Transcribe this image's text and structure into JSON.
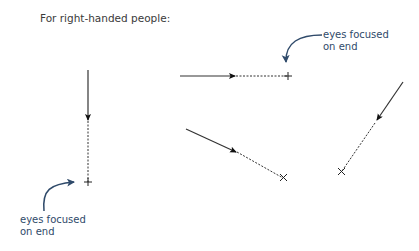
{
  "title": "For right-handed people:",
  "annotations": [
    {
      "line1": "eyes focused",
      "line2": "on end",
      "position": "top-right"
    },
    {
      "line1": "eyes focused",
      "line2": "on end",
      "position": "bottom-left"
    }
  ],
  "colors": {
    "stroke": "#222222",
    "annotation": "#2f4a6a"
  },
  "strokes": [
    {
      "name": "vertical-down",
      "solid": [
        [
          88,
          70
        ],
        [
          88,
          118
        ]
      ],
      "dashed": [
        [
          88,
          118
        ],
        [
          88,
          182
        ]
      ],
      "end": [
        88,
        182
      ]
    },
    {
      "name": "horizontal-right",
      "solid": [
        [
          180,
          76
        ],
        [
          235,
          76
        ]
      ],
      "dashed": [
        [
          235,
          76
        ],
        [
          288,
          76
        ]
      ],
      "end": [
        288,
        76
      ]
    },
    {
      "name": "diagonal-down-right",
      "solid": [
        [
          186,
          129
        ],
        [
          238,
          152
        ]
      ],
      "dashed": [
        [
          238,
          152
        ],
        [
          284,
          178
        ]
      ],
      "end": [
        284,
        178
      ]
    },
    {
      "name": "diagonal-down-left",
      "solid": [
        [
          403,
          82
        ],
        [
          376,
          122
        ]
      ],
      "dashed": [
        [
          376,
          122
        ],
        [
          342,
          172
        ]
      ],
      "end": [
        342,
        172
      ]
    }
  ]
}
